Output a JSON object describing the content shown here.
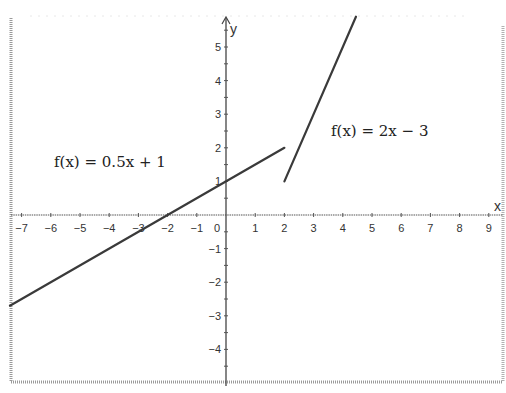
{
  "chart_data": {
    "type": "line",
    "title": "",
    "xlabel": "x",
    "ylabel": "y",
    "xlim": [
      -7.4,
      9.5
    ],
    "ylim": [
      -5,
      5.9
    ],
    "grid": false,
    "x_ticks": [
      -7,
      -6,
      -5,
      -4,
      -3,
      -2,
      -1,
      0,
      1,
      2,
      3,
      4,
      5,
      6,
      7,
      8,
      9
    ],
    "y_ticks": [
      -4,
      -3,
      -2,
      -1,
      1,
      2,
      3,
      4,
      5
    ],
    "series": [
      {
        "name": "f(x) = 0.5x + 1",
        "equation": "0.5x + 1",
        "domain": [
          -7.4,
          2
        ],
        "points": [
          [
            -7.4,
            -2.7
          ],
          [
            2,
            2
          ]
        ]
      },
      {
        "name": "f(x) = 2x - 3",
        "equation": "2x - 3",
        "domain": [
          2,
          4.45
        ],
        "points": [
          [
            2,
            1
          ],
          [
            4.45,
            5.9
          ]
        ]
      }
    ],
    "annotations": [
      {
        "text": "f(x) = 0.5x + 1",
        "x": -6,
        "y": 1.5
      },
      {
        "text": "f(x) = 2x − 3",
        "x": 3.6,
        "y": 2.5
      }
    ]
  },
  "labels": {
    "x_axis": "x",
    "y_axis": "y",
    "origin": "0",
    "fn1": "f(x) = 0.5x + 1",
    "fn2": "f(x) = 2x − 3"
  },
  "colors": {
    "line": "#3a3a3a",
    "axis": "#444444",
    "frame": "#9a9a9a"
  }
}
